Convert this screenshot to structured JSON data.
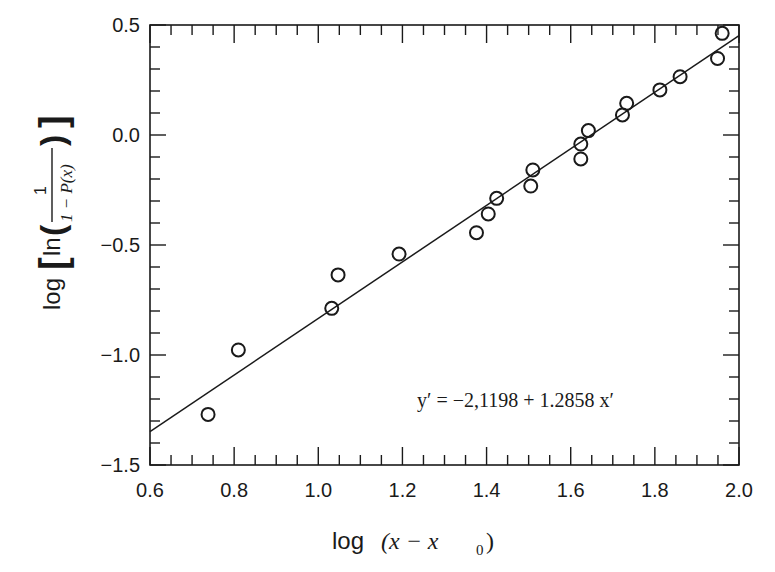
{
  "chart_data": {
    "type": "scatter",
    "title": "",
    "xlabel": "log (x − x0)",
    "ylabel": "log[ln(1/(1 − P(x)))]",
    "xlim": [
      0.6,
      2.0
    ],
    "ylim": [
      -1.5,
      0.5
    ],
    "x_ticks": [
      0.6,
      0.8,
      1.0,
      1.2,
      1.4,
      1.6,
      1.8,
      2.0
    ],
    "x_tick_labels": [
      "0.6",
      "0.8",
      "1.0",
      "1.2",
      "1.4",
      "1.6",
      "1.8",
      "2.0"
    ],
    "x_minor_step": 0.05,
    "y_ticks": [
      -1.5,
      -1.0,
      -0.5,
      0.0,
      0.5
    ],
    "y_tick_labels": [
      "−1.5",
      "−1.0",
      "−0.5",
      "0.0",
      "0.5"
    ],
    "y_minor_step": 0.1,
    "grid": false,
    "legend": null,
    "series": [
      {
        "name": "observations",
        "marker": "open-circle",
        "points": [
          {
            "x": 0.738,
            "y": -1.27
          },
          {
            "x": 0.81,
            "y": -0.977
          },
          {
            "x": 1.032,
            "y": -0.788
          },
          {
            "x": 1.047,
            "y": -0.636
          },
          {
            "x": 1.192,
            "y": -0.541
          },
          {
            "x": 1.376,
            "y": -0.444
          },
          {
            "x": 1.404,
            "y": -0.359
          },
          {
            "x": 1.424,
            "y": -0.288
          },
          {
            "x": 1.505,
            "y": -0.232
          },
          {
            "x": 1.51,
            "y": -0.159
          },
          {
            "x": 1.624,
            "y": -0.109
          },
          {
            "x": 1.624,
            "y": -0.041
          },
          {
            "x": 1.642,
            "y": 0.02
          },
          {
            "x": 1.723,
            "y": 0.091
          },
          {
            "x": 1.733,
            "y": 0.144
          },
          {
            "x": 1.812,
            "y": 0.205
          },
          {
            "x": 1.86,
            "y": 0.265
          },
          {
            "x": 1.949,
            "y": 0.348
          },
          {
            "x": 1.96,
            "y": 0.462
          }
        ]
      },
      {
        "name": "linear fit",
        "type": "line",
        "intercept": -2.1198,
        "slope": 1.2858,
        "x_range": [
          0.6,
          2.0
        ]
      }
    ],
    "annotations": [
      {
        "text": "y′ = −2,1198 + 1.2858 x′",
        "x": 1.35,
        "y": -1.23
      }
    ]
  },
  "labels": {
    "equation": "y′ = −2,1198 + 1.2858 x′",
    "xlabel_log": "log",
    "xlabel_expr": "(x − x",
    "xlabel_sub": "0",
    "xlabel_close": ")",
    "ylabel_log": "log",
    "ylabel_ln": "ln",
    "ylabel_num": "1",
    "ylabel_den": "1 − P(x)"
  }
}
